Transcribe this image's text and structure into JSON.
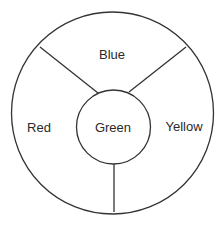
{
  "diagram": {
    "type": "segmented-ring",
    "line_color": "#333333",
    "background": "#ffffff",
    "center_label": "Green",
    "segments": [
      {
        "label": "Blue",
        "position": "top"
      },
      {
        "label": "Red",
        "position": "left"
      },
      {
        "label": "Yellow",
        "position": "right"
      }
    ]
  }
}
